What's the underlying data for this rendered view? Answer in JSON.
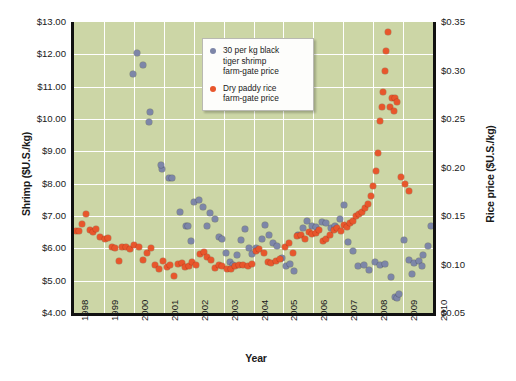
{
  "chart_data": {
    "type": "scatter",
    "title": "",
    "xlabel": "Year",
    "ylabel": "Shrimp ($U.S./kg)",
    "y2label": "Rice price ($U.S./kg)",
    "xlim": [
      1998,
      2010
    ],
    "ylim": [
      4.0,
      13.0
    ],
    "y2lim": [
      0.05,
      0.35
    ],
    "grid": true,
    "legend_position": "top-right-inside",
    "background_color": "#ccd6a6",
    "gridline_color": "#ffffff",
    "xticks": [
      "1998",
      "1999",
      "2000",
      "2001",
      "2002",
      "2003",
      "2004",
      "2005",
      "2006",
      "2007",
      "2008",
      "2009",
      "2010"
    ],
    "yticks_left": [
      "$4.00",
      "$5.00",
      "$6.00",
      "$7.00",
      "$8.00",
      "$9.00",
      "$10.00",
      "$11.00",
      "$12.00",
      "$13.00"
    ],
    "yticks_right": [
      "$0.05",
      "$0.10",
      "$0.15",
      "$0.20",
      "$0.25",
      "$0.30",
      "$0.35"
    ],
    "series": [
      {
        "name": "30 per kg black tiger shrimp farm-gate price",
        "color": "#7d86a8",
        "axis": "left",
        "unit": "$U.S./kg",
        "points": [
          [
            2000.12,
            12.05
          ],
          [
            2000.3,
            11.68
          ],
          [
            1999.98,
            11.38
          ],
          [
            2000.55,
            10.22
          ],
          [
            2000.52,
            9.9
          ],
          [
            2000.95,
            8.44
          ],
          [
            2000.92,
            8.57
          ],
          [
            2001.18,
            8.18
          ],
          [
            2001.26,
            8.16
          ],
          [
            2001.55,
            7.12
          ],
          [
            2001.74,
            6.7
          ],
          [
            2001.8,
            6.68
          ],
          [
            2001.92,
            6.22
          ],
          [
            2002.02,
            7.44
          ],
          [
            2002.18,
            7.5
          ],
          [
            2002.3,
            7.28
          ],
          [
            2002.46,
            6.7
          ],
          [
            2002.55,
            7.1
          ],
          [
            2002.7,
            6.9
          ],
          [
            2002.84,
            6.35
          ],
          [
            2002.95,
            6.3
          ],
          [
            2003.08,
            5.86
          ],
          [
            2003.2,
            5.58
          ],
          [
            2003.32,
            5.5
          ],
          [
            2003.44,
            5.8
          ],
          [
            2003.58,
            6.25
          ],
          [
            2003.7,
            6.6
          ],
          [
            2003.84,
            6.0
          ],
          [
            2003.96,
            5.82
          ],
          [
            2004.1,
            6.02
          ],
          [
            2004.28,
            6.3
          ],
          [
            2004.4,
            6.72
          ],
          [
            2004.52,
            6.42
          ],
          [
            2004.66,
            6.18
          ],
          [
            2004.8,
            6.06
          ],
          [
            2004.94,
            5.7
          ],
          [
            2005.1,
            5.46
          ],
          [
            2005.22,
            5.52
          ],
          [
            2005.36,
            5.3
          ],
          [
            2005.5,
            6.4
          ],
          [
            2005.66,
            6.62
          ],
          [
            2005.8,
            6.84
          ],
          [
            2005.95,
            6.7
          ],
          [
            2006.1,
            6.66
          ],
          [
            2006.28,
            6.82
          ],
          [
            2006.42,
            6.78
          ],
          [
            2006.58,
            6.62
          ],
          [
            2006.74,
            6.7
          ],
          [
            2006.9,
            6.92
          ],
          [
            2007.02,
            7.34
          ],
          [
            2007.16,
            6.2
          ],
          [
            2007.32,
            5.92
          ],
          [
            2007.5,
            5.46
          ],
          [
            2007.68,
            5.48
          ],
          [
            2007.86,
            5.34
          ],
          [
            2008.06,
            5.58
          ],
          [
            2008.22,
            5.5
          ],
          [
            2008.4,
            5.52
          ],
          [
            2008.58,
            5.1
          ],
          [
            2008.74,
            4.5
          ],
          [
            2008.8,
            4.46
          ],
          [
            2008.86,
            4.58
          ],
          [
            2009.04,
            6.26
          ],
          [
            2009.2,
            5.64
          ],
          [
            2009.36,
            5.56
          ],
          [
            2009.52,
            5.62
          ],
          [
            2009.68,
            5.78
          ],
          [
            2009.84,
            6.08
          ],
          [
            2009.94,
            6.7
          ],
          [
            2009.3,
            5.2
          ],
          [
            2009.62,
            5.44
          ]
        ]
      },
      {
        "name": "Dry paddy rice farm-gate price",
        "color": "#e8562c",
        "axis": "right",
        "unit": "$U.S./kg",
        "points": [
          [
            1998.06,
            0.135
          ],
          [
            1998.16,
            0.135
          ],
          [
            1998.26,
            0.142
          ],
          [
            1998.4,
            0.152
          ],
          [
            1998.54,
            0.136
          ],
          [
            1998.62,
            0.134
          ],
          [
            1998.72,
            0.137
          ],
          [
            1998.86,
            0.128
          ],
          [
            1999.02,
            0.126
          ],
          [
            1999.14,
            0.127
          ],
          [
            1999.26,
            0.118
          ],
          [
            1999.38,
            0.117
          ],
          [
            1999.5,
            0.104
          ],
          [
            1999.62,
            0.118
          ],
          [
            1999.74,
            0.118
          ],
          [
            1999.86,
            0.116
          ],
          [
            2000.02,
            0.12
          ],
          [
            2000.16,
            0.118
          ],
          [
            2000.3,
            0.105
          ],
          [
            2000.44,
            0.112
          ],
          [
            2000.58,
            0.117
          ],
          [
            2000.7,
            0.1
          ],
          [
            2000.84,
            0.095
          ],
          [
            2000.96,
            0.104
          ],
          [
            2001.1,
            0.097
          ],
          [
            2001.22,
            0.1
          ],
          [
            2001.34,
            0.088
          ],
          [
            2001.48,
            0.101
          ],
          [
            2001.6,
            0.102
          ],
          [
            2001.72,
            0.097
          ],
          [
            2001.86,
            0.098
          ],
          [
            2001.96,
            0.103
          ],
          [
            2002.08,
            0.099
          ],
          [
            2002.2,
            0.111
          ],
          [
            2002.34,
            0.113
          ],
          [
            2002.46,
            0.108
          ],
          [
            2002.58,
            0.105
          ],
          [
            2002.72,
            0.096
          ],
          [
            2002.86,
            0.1
          ],
          [
            2002.96,
            0.098
          ],
          [
            2003.1,
            0.095
          ],
          [
            2003.24,
            0.095
          ],
          [
            2003.38,
            0.098
          ],
          [
            2003.52,
            0.099
          ],
          [
            2003.66,
            0.1
          ],
          [
            2003.8,
            0.098
          ],
          [
            2003.94,
            0.101
          ],
          [
            2004.08,
            0.114
          ],
          [
            2004.2,
            0.116
          ],
          [
            2004.34,
            0.112
          ],
          [
            2004.48,
            0.103
          ],
          [
            2004.6,
            0.102
          ],
          [
            2004.74,
            0.104
          ],
          [
            2004.88,
            0.106
          ],
          [
            2005.04,
            0.118
          ],
          [
            2005.18,
            0.122
          ],
          [
            2005.32,
            0.112
          ],
          [
            2005.46,
            0.129
          ],
          [
            2005.58,
            0.13
          ],
          [
            2005.72,
            0.126
          ],
          [
            2005.86,
            0.134
          ],
          [
            2005.96,
            0.131
          ],
          [
            2006.08,
            0.132
          ],
          [
            2006.2,
            0.136
          ],
          [
            2006.32,
            0.124
          ],
          [
            2006.44,
            0.126
          ],
          [
            2006.56,
            0.13
          ],
          [
            2006.68,
            0.136
          ],
          [
            2006.8,
            0.138
          ],
          [
            2006.92,
            0.135
          ],
          [
            2007.04,
            0.141
          ],
          [
            2007.14,
            0.139
          ],
          [
            2007.24,
            0.143
          ],
          [
            2007.34,
            0.145
          ],
          [
            2007.44,
            0.15
          ],
          [
            2007.54,
            0.152
          ],
          [
            2007.64,
            0.154
          ],
          [
            2007.74,
            0.158
          ],
          [
            2007.84,
            0.162
          ],
          [
            2007.92,
            0.171
          ],
          [
            2008.0,
            0.181
          ],
          [
            2008.08,
            0.196
          ],
          [
            2008.16,
            0.215
          ],
          [
            2008.22,
            0.248
          ],
          [
            2008.3,
            0.262
          ],
          [
            2008.34,
            0.278
          ],
          [
            2008.4,
            0.3
          ],
          [
            2008.44,
            0.32
          ],
          [
            2008.48,
            0.34
          ],
          [
            2008.56,
            0.262
          ],
          [
            2008.62,
            0.272
          ],
          [
            2008.68,
            0.258
          ],
          [
            2008.74,
            0.272
          ],
          [
            2008.8,
            0.268
          ],
          [
            2008.94,
            0.19
          ],
          [
            2009.06,
            0.183
          ],
          [
            2009.2,
            0.176
          ]
        ]
      }
    ]
  },
  "legend": {
    "items": [
      {
        "label": "30 per kg black\ntiger shrimp\nfarm-gate price",
        "color": "#7d86a8",
        "marker": "circle-shrimp-icon"
      },
      {
        "label": "Dry paddy rice\nfarm-gate price",
        "color": "#e8562c",
        "marker": "circle-rice-icon"
      }
    ]
  }
}
